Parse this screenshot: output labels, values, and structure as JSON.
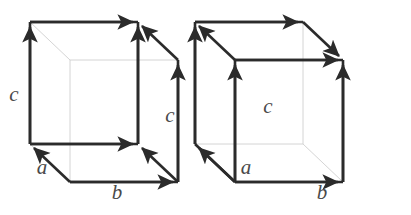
{
  "figure": {
    "name": "crystal-unit-cell-vector-pair",
    "background_color": "#ffffff",
    "edge_color": "#2b2b2b",
    "hidden_edge_color": "#cfcfcf",
    "label_color": "#4a4a4a",
    "edge_width": 2.6,
    "hidden_edge_width": 0.9
  },
  "cubes": [
    {
      "id": "left-cube",
      "name": "left-unit-cell",
      "labels": [
        {
          "id": "c-left",
          "text": "c",
          "x": 14,
          "y": 101,
          "name": "vector-label-c-left"
        },
        {
          "id": "c-right",
          "text": "c",
          "x": 170,
          "y": 122,
          "name": "vector-label-c-right"
        },
        {
          "id": "a",
          "text": "a",
          "x": 42,
          "y": 174,
          "name": "vector-label-a"
        },
        {
          "id": "b",
          "text": "b",
          "x": 117,
          "y": 199,
          "name": "vector-label-b"
        }
      ],
      "vertices": {
        "front_bottom_left": [
          30,
          144
        ],
        "front_bottom_right": [
          138,
          144
        ],
        "front_top_left": [
          30,
          22
        ],
        "front_top_right": [
          138,
          22
        ],
        "back_bottom_left": [
          70,
          182
        ],
        "back_bottom_right": [
          178,
          182
        ],
        "back_top_left": [
          70,
          60
        ],
        "back_top_right": [
          178,
          60
        ]
      }
    },
    {
      "id": "right-cube",
      "name": "right-unit-cell",
      "labels": [
        {
          "id": "c",
          "text": "c",
          "x": 268,
          "y": 113,
          "name": "vector-label-c"
        },
        {
          "id": "a",
          "text": "a",
          "x": 246,
          "y": 174,
          "name": "vector-label-a"
        },
        {
          "id": "b",
          "text": "b",
          "x": 322,
          "y": 199,
          "name": "vector-label-b"
        }
      ],
      "vertices": {
        "front_bottom_left": [
          235,
          182
        ],
        "front_bottom_right": [
          343,
          182
        ],
        "front_top_left": [
          235,
          60
        ],
        "front_top_right": [
          343,
          60
        ],
        "back_bottom_left": [
          195,
          144
        ],
        "back_bottom_right": [
          303,
          144
        ],
        "back_top_left": [
          195,
          22
        ],
        "back_top_right": [
          303,
          22
        ]
      }
    }
  ]
}
